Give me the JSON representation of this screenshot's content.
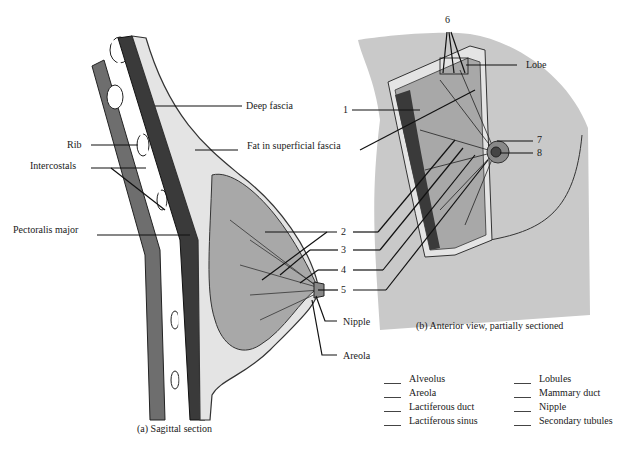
{
  "sagittal": {
    "caption": "(a) Sagittal section",
    "labels": {
      "deep_fascia": "Deep fascia",
      "fat": "Fat in superficial fascia",
      "rib": "Rib",
      "intercostals": "Intercostals",
      "pectoralis": "Pectoralis major",
      "nipple": "Nipple",
      "areola": "Areola"
    },
    "numbers": [
      "2",
      "3",
      "4",
      "5"
    ]
  },
  "anterior": {
    "caption": "(b) Anterior view, partially sectioned",
    "labels": {
      "lobe": "Lobe"
    },
    "numbers": {
      "n1": "1",
      "n6": "6",
      "n7": "7",
      "n8": "8"
    }
  },
  "word_bank": [
    "Alveolus",
    "Lobules",
    "Areola",
    "Mammary duct",
    "Lactiferous duct",
    "Nipple",
    "Lactiferous sinus",
    "Secondary tubules"
  ],
  "colors": {
    "skin": "#c9c9c9",
    "tissue": "#a8a8a8",
    "muscle": "#3a3a3a",
    "fat": "#e4e4e4",
    "line": "#1a1a1a"
  }
}
